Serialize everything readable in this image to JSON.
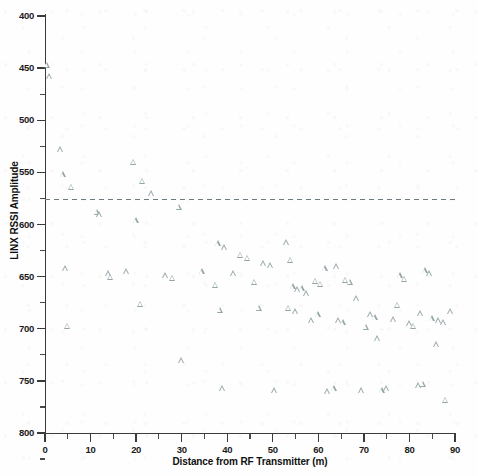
{
  "chart_data": {
    "type": "scatter",
    "title": "",
    "xlabel": "Distance from RF Transmitter (m)",
    "ylabel": "LINX RSSI Amplitude",
    "xlim": [
      0,
      90
    ],
    "ylim": [
      400,
      800
    ],
    "xticks": [
      0,
      10,
      20,
      30,
      40,
      50,
      60,
      70,
      80,
      90
    ],
    "yticks": [
      400,
      450,
      500,
      550,
      600,
      650,
      700,
      750,
      800
    ],
    "grid": false,
    "legend": null,
    "marker": "open-triangle",
    "marker_color": "#829698",
    "reference_line": {
      "orientation": "horizontal",
      "y": 624,
      "style": "dashed",
      "color": "#6d7a80"
    },
    "points": [
      [
        0.5,
        753
      ],
      [
        1.0,
        742
      ],
      [
        3.5,
        672
      ],
      [
        4.0,
        648
      ],
      [
        5.8,
        636
      ],
      [
        4.5,
        558
      ],
      [
        5.0,
        503
      ],
      [
        11.5,
        612
      ],
      [
        12.0,
        610
      ],
      [
        19.5,
        660
      ],
      [
        21.5,
        642
      ],
      [
        23.5,
        630
      ],
      [
        20.0,
        604
      ],
      [
        14.0,
        553
      ],
      [
        14.5,
        550
      ],
      [
        18.0,
        555
      ],
      [
        21.0,
        524
      ],
      [
        29.5,
        617
      ],
      [
        26.5,
        551
      ],
      [
        28.0,
        549
      ],
      [
        30.0,
        470
      ],
      [
        34.5,
        555
      ],
      [
        38.0,
        582
      ],
      [
        39.5,
        578
      ],
      [
        37.5,
        542
      ],
      [
        38.5,
        518
      ],
      [
        39.0,
        443
      ],
      [
        43.0,
        571
      ],
      [
        44.5,
        568
      ],
      [
        41.5,
        553
      ],
      [
        46.0,
        545
      ],
      [
        48.0,
        563
      ],
      [
        49.5,
        561
      ],
      [
        47.0,
        520
      ],
      [
        50.5,
        441
      ],
      [
        53.0,
        583
      ],
      [
        54.0,
        566
      ],
      [
        54.5,
        541
      ],
      [
        55.5,
        538
      ],
      [
        56.5,
        539
      ],
      [
        53.5,
        520
      ],
      [
        55.0,
        517
      ],
      [
        57.5,
        534
      ],
      [
        58.5,
        508
      ],
      [
        59.5,
        546
      ],
      [
        60.5,
        543
      ],
      [
        60.0,
        514
      ],
      [
        61.5,
        558
      ],
      [
        62.0,
        440
      ],
      [
        63.5,
        443
      ],
      [
        64.5,
        508
      ],
      [
        65.5,
        506
      ],
      [
        66.0,
        547
      ],
      [
        67.0,
        545
      ],
      [
        64.0,
        560
      ],
      [
        68.5,
        529
      ],
      [
        69.5,
        441
      ],
      [
        71.5,
        514
      ],
      [
        72.5,
        511
      ],
      [
        70.5,
        502
      ],
      [
        73.0,
        491
      ],
      [
        74.0,
        441
      ],
      [
        75.0,
        443
      ],
      [
        76.5,
        509
      ],
      [
        78.0,
        551
      ],
      [
        79.0,
        548
      ],
      [
        77.5,
        523
      ],
      [
        80.0,
        505
      ],
      [
        81.0,
        503
      ],
      [
        82.5,
        515
      ],
      [
        83.5,
        556
      ],
      [
        84.5,
        553
      ],
      [
        82.0,
        446
      ],
      [
        83.0,
        447
      ],
      [
        85.0,
        510
      ],
      [
        86.5,
        508
      ],
      [
        87.5,
        506
      ],
      [
        86.0,
        485
      ],
      [
        88.0,
        432
      ],
      [
        89.0,
        517
      ]
    ]
  },
  "axes": {
    "y_tick_labels": [
      "800",
      "750",
      "700",
      "650",
      "600",
      "550",
      "500",
      "450",
      "400"
    ],
    "x_tick_labels": [
      "0",
      "10",
      "20",
      "30",
      "40",
      "50",
      "60",
      "70",
      "80",
      "90"
    ],
    "x_title": "Distance from RF Transmitter (m)",
    "y_title": "LINX RSSI Amplitude"
  }
}
